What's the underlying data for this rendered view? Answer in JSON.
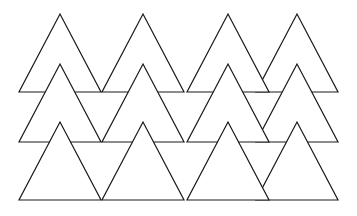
{
  "diagram": {
    "title": "",
    "colors": {
      "background": "#ffffff",
      "stroke": "#1a1a1a",
      "fill": "#ffffff"
    },
    "triangle": {
      "half_width": 41,
      "height": 78
    },
    "rows": [
      {
        "name": "row-top",
        "apex_y": 14,
        "apexes_x": [
          60,
          143,
          228,
          297
        ]
      },
      {
        "name": "row-middle",
        "apex_y": 64,
        "apexes_x": [
          60,
          143,
          228,
          297
        ]
      },
      {
        "name": "row-bottom",
        "apex_y": 122,
        "apexes_x": [
          60,
          143,
          228,
          297
        ]
      }
    ]
  }
}
